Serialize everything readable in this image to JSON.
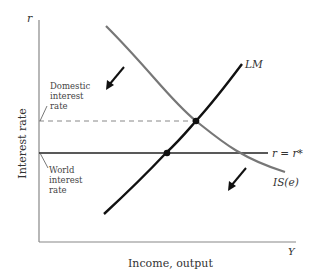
{
  "diagram": {
    "axes": {
      "y_axis_symbol": "r",
      "x_axis_symbol": "Y",
      "y_label": "Interest rate",
      "x_label": "Income, output"
    },
    "curves": {
      "lm_label": "LM",
      "is_label": "IS(e)",
      "world_rate_label": "r = r*"
    },
    "annotations": {
      "domestic_rate": [
        "Domestic",
        "interest",
        "rate"
      ],
      "world_rate": [
        "World",
        "interest",
        "rate"
      ]
    },
    "colors": {
      "lm_curve": "#111111",
      "is_curve": "#777777",
      "axis": "#888888",
      "world_rate_line": "#222222",
      "dashed_line": "#888888"
    }
  }
}
